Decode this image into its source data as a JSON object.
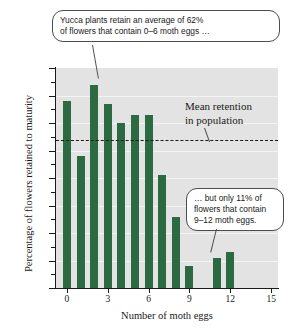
{
  "chart_data": {
    "type": "bar",
    "title": "",
    "xlabel": "Number of moth eggs",
    "ylabel": "Percentage of flowers retained to maturity",
    "categories": [
      "0",
      "1",
      "2",
      "3",
      "4",
      "5",
      "6",
      "7",
      "8",
      "9",
      "10",
      "11",
      "12"
    ],
    "values": [
      68,
      48,
      74,
      67,
      60,
      63,
      63,
      41,
      26,
      8,
      0,
      11,
      13
    ],
    "xlim": [
      -0.8,
      15.5
    ],
    "ylim": [
      0,
      80
    ],
    "xticks": [
      "0",
      "3",
      "6",
      "9",
      "12",
      "15"
    ],
    "xtick_values": [
      0,
      3,
      6,
      9,
      12,
      15
    ],
    "yticks": [
      "0",
      "10",
      "20",
      "30",
      "40",
      "50",
      "60",
      "70",
      "80"
    ],
    "ytick_values": [
      0,
      10,
      20,
      30,
      40,
      50,
      60,
      70,
      80
    ],
    "grid": true,
    "legend": "none",
    "bar_color": "#2c6b42",
    "plot_background": "#e3e3e3",
    "reference_line": {
      "label": "Mean retention in population",
      "value": 54,
      "style": "dashed",
      "color": "#1a1a1a"
    },
    "annotations": [
      {
        "id": "left",
        "text": "Yucca plants retain an average of 62% of flowers that contain 0–6 moth eggs …",
        "points_to_category": "2"
      },
      {
        "id": "right",
        "text": "… but only 11% of flowers that contain 9–12 moth eggs.",
        "points_to_category": "11"
      }
    ]
  },
  "axes": {
    "y_title": "Percentage of flowers retained to maturity",
    "x_title": "Number of moth eggs"
  },
  "mean_label": {
    "line1": "Mean retention",
    "line2": "in population"
  },
  "callouts": {
    "left_line1": "Yucca plants retain an average of 62%",
    "left_line2": "of flowers that contain 0–6 moth eggs …",
    "right_line1": "… but only 11% of",
    "right_line2": "flowers that contain",
    "right_line3": "9–12 moth eggs."
  }
}
